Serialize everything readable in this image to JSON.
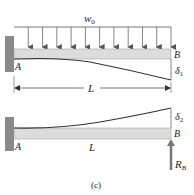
{
  "figure": {
    "caption": "(c)",
    "top_diagram": {
      "load_label": "w",
      "load_sub": "0",
      "end_a_label": "A",
      "end_b_label": "B",
      "deflection_label": "δ",
      "deflection_sub": "1",
      "span_label": "L"
    },
    "bottom_diagram": {
      "end_a_label": "A",
      "end_b_label": "B",
      "deflection_label": "δ",
      "deflection_sub": "2",
      "span_label": "L",
      "reaction_label": "R",
      "reaction_sub": "B"
    },
    "colors": {
      "wall": "#8a8a8a",
      "beam_fill": "#dcdcdc",
      "line": "#333333",
      "arrow": "#666666"
    }
  }
}
